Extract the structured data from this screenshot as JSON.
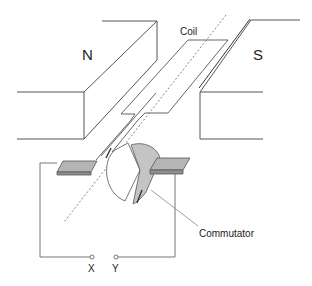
{
  "diagram": {
    "labels": {
      "north_pole": "N",
      "south_pole": "S",
      "coil": "Coil",
      "commutator": "Commutator",
      "terminal_x": "X",
      "terminal_y": "Y"
    },
    "colors": {
      "line": "#555555",
      "brush_fill": "#b5b5b5",
      "commutator_fill": "#c4c4c4",
      "text": "#222222",
      "background": "#ffffff"
    }
  }
}
